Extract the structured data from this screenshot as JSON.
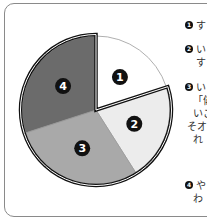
{
  "chart_data": {
    "type": "pie",
    "title": "",
    "slices": [
      {
        "label": "1",
        "value": 20,
        "color": "#ffffff"
      },
      {
        "label": "2",
        "value": 21,
        "color": "#ececec"
      },
      {
        "label": "3",
        "value": 29,
        "color": "#a9a9a9"
      },
      {
        "label": "4",
        "value": 30,
        "color": "#6b6b6b"
      }
    ],
    "start_angle_deg": -90,
    "direction": "clockwise",
    "grouped_outline_slices": [
      "2",
      "3",
      "4"
    ]
  },
  "legend": {
    "items": [
      {
        "marker": "1",
        "lines": [
          "す"
        ]
      },
      {
        "marker": "2",
        "lines": [
          "い",
          "す"
        ]
      },
      {
        "marker": "3",
        "lines": [
          "い",
          "「偁",
          "いこ",
          "そオ",
          "れ"
        ]
      },
      {
        "marker": "4",
        "lines": [
          "や",
          "わ"
        ]
      }
    ]
  }
}
